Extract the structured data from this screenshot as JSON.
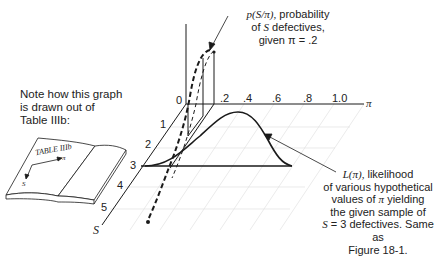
{
  "note": {
    "lines": [
      "Note how this graph",
      "is drawn out of",
      "Table IIIb:"
    ]
  },
  "book": {
    "title": "TABLE IIIb",
    "arrow_right_label": "π",
    "arrow_down_label": "S"
  },
  "callout_top": {
    "line1_math": "p(S/π),",
    "line1_text": "probability",
    "line2_pre": "of",
    "line2_math": "S",
    "line2_post": "defectives,",
    "line3": "given π = .2"
  },
  "callout_bottom": {
    "line1_math": "L(π),",
    "line1_text": "likelihood",
    "line2": "of various hypothetical",
    "line3_pre": "values of",
    "line3_math": "π",
    "line3_post": "yielding",
    "line4": "the given sample of",
    "line5_math": "S",
    "line5_post": "= 3 defectives. Same as",
    "line6": "Figure 18-1."
  },
  "axes": {
    "pi_axis": {
      "label": "π",
      "ticks": [
        ".2",
        ".4",
        ".6",
        ".8",
        "1.0"
      ],
      "origin": "0"
    },
    "s_axis": {
      "label": "S",
      "ticks": [
        "1",
        "2",
        "3",
        "4",
        "5"
      ]
    }
  },
  "colors": {
    "ink": "#1a1a1a",
    "grid": "#d8d8d8",
    "background": "#ffffff"
  }
}
